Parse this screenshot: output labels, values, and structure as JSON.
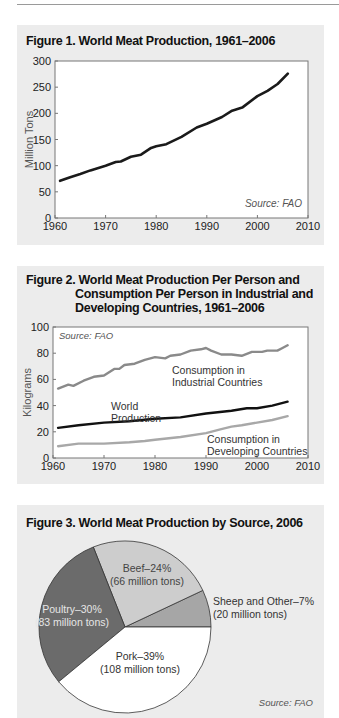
{
  "figures": {
    "fig1": {
      "title": "Figure 1. World Meat Production, 1961–2006",
      "ylabel": "Million Tons",
      "source": "Source: FAO"
    },
    "fig2": {
      "title_line1": "Figure 2. World Meat Production Per Person and",
      "title_line2": "Consumption Per Person in Industrial and",
      "title_line3": "Developing Countries, 1961–2006",
      "ylabel": "Kilograms",
      "source": "Source: FAO",
      "label_industrial_1": "Consumption in",
      "label_industrial_2": "Industrial Countries",
      "label_world_1": "World",
      "label_world_2": "Production",
      "label_developing_1": "Consumption in",
      "label_developing_2": "Developing Countries"
    },
    "fig3": {
      "title": "Figure 3. World Meat Production by Source, 2006",
      "source": "Source: FAO",
      "beef_1": "Beef–24%",
      "beef_2": "(66 million tons)",
      "sheep_1": "Sheep and Other–7%",
      "sheep_2": "(20 million tons)",
      "poultry_1": "Poultry–30%",
      "poultry_2": "(83 million tons)",
      "pork_1": "Pork–39%",
      "pork_2": "(108 million tons)"
    }
  },
  "chart_data": [
    {
      "type": "line",
      "title": "Figure 1. World Meat Production, 1961–2006",
      "xlabel": "",
      "ylabel": "Million Tons",
      "xlim": [
        1960,
        2010
      ],
      "ylim": [
        0,
        300
      ],
      "xticks": [
        1960,
        1970,
        1980,
        1990,
        2000,
        2010
      ],
      "yticks": [
        0,
        50,
        100,
        150,
        200,
        250,
        300
      ],
      "grid": false,
      "annotations": [
        "Source: FAO"
      ],
      "series": [
        {
          "name": "World Meat Production",
          "color": "#1a1a1a",
          "x": [
            1961,
            1963,
            1965,
            1967,
            1970,
            1972,
            1973,
            1975,
            1977,
            1979,
            1980,
            1982,
            1985,
            1988,
            1990,
            1993,
            1995,
            1997,
            2000,
            2002,
            2004,
            2006
          ],
          "y": [
            71,
            78,
            84,
            91,
            100,
            107,
            108,
            117,
            121,
            134,
            137,
            141,
            155,
            173,
            180,
            193,
            205,
            211,
            233,
            243,
            256,
            276
          ]
        }
      ]
    },
    {
      "type": "line",
      "title": "Figure 2. World Meat Production Per Person and Consumption Per Person in Industrial and Developing Countries, 1961–2006",
      "xlabel": "",
      "ylabel": "Kilograms",
      "xlim": [
        1960,
        2010
      ],
      "ylim": [
        0,
        100
      ],
      "xticks": [
        1960,
        1970,
        1980,
        1990,
        2000,
        2010
      ],
      "yticks": [
        0,
        20,
        40,
        60,
        80,
        100
      ],
      "grid": false,
      "annotations": [
        "Source: FAO"
      ],
      "series": [
        {
          "name": "Consumption in Industrial Countries",
          "color": "#8a8a8a",
          "x": [
            1961,
            1963,
            1964,
            1966,
            1968,
            1970,
            1972,
            1973,
            1974,
            1976,
            1978,
            1980,
            1982,
            1983,
            1985,
            1987,
            1989,
            1990,
            1991,
            1993,
            1995,
            1997,
            1999,
            2001,
            2002,
            2004,
            2005,
            2006
          ],
          "y": [
            53,
            56,
            55,
            59,
            62,
            63,
            68,
            68,
            71,
            72,
            75,
            77,
            76,
            78,
            79,
            82,
            83,
            84,
            82,
            79,
            79,
            78,
            81,
            81,
            82,
            82,
            84,
            86
          ]
        },
        {
          "name": "World Production",
          "color": "#111111",
          "x": [
            1961,
            1965,
            1970,
            1975,
            1980,
            1985,
            1990,
            1995,
            1998,
            2000,
            2003,
            2006
          ],
          "y": [
            23,
            25,
            27,
            28,
            30,
            31,
            34,
            36,
            38,
            38,
            40,
            43
          ]
        },
        {
          "name": "Consumption in Developing Countries",
          "color": "#a8a8a8",
          "x": [
            1961,
            1965,
            1970,
            1975,
            1978,
            1980,
            1985,
            1990,
            1993,
            1995,
            1997,
            2000,
            2003,
            2006
          ],
          "y": [
            9,
            11,
            11,
            12,
            13,
            14,
            16,
            19,
            22,
            24,
            25,
            27,
            29,
            32
          ]
        }
      ]
    },
    {
      "type": "pie",
      "title": "Figure 3. World Meat Production by Source, 2006",
      "annotations": [
        "Source: FAO"
      ],
      "categories": [
        "Pork",
        "Poultry",
        "Beef",
        "Sheep and Other"
      ],
      "values": [
        39,
        30,
        24,
        7
      ],
      "units": "percent",
      "million_tons": [
        108,
        83,
        66,
        20
      ],
      "colors": [
        "#ffffff",
        "#6b6b6b",
        "#cdcdcd",
        "#a6a6a6"
      ]
    }
  ]
}
